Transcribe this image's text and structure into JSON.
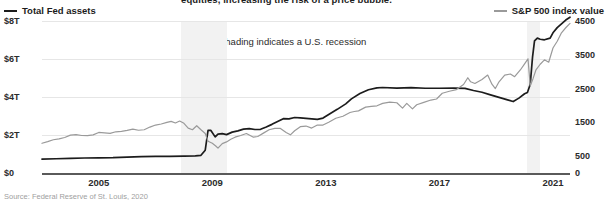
{
  "caption_fragment": "equities, increasing the risk of a price bubble.",
  "legend": {
    "left": {
      "label": "Total Fed assets",
      "color": "#1c1c1c",
      "marker": "line-swatch"
    },
    "right": {
      "label": "S&P 500 index value",
      "color": "#9a9a9a",
      "marker": "line-swatch"
    }
  },
  "annotation": {
    "arrow_icon": "◂",
    "text": "Shading indicates a U.S. recession"
  },
  "source": "Source: Federal Reserve of St. Louis, 2020",
  "chart_data": {
    "type": "line",
    "title": "",
    "subtitle": "",
    "xlabel": "",
    "ylabel": "",
    "grid": true,
    "legend_position": "top",
    "x_axis": {
      "ticks": [
        2005,
        2009,
        2013,
        2017,
        2021
      ],
      "tick_labels": [
        "2005",
        "2009",
        "2013",
        "2017",
        "2021"
      ],
      "xlim": [
        2003.0,
        2021.6
      ]
    },
    "y_axis_left": {
      "label": "Total Fed assets",
      "ticks": [
        0,
        2,
        4,
        6,
        8
      ],
      "tick_labels": [
        "$0",
        "$2T",
        "$4T",
        "$6T",
        "$8T"
      ],
      "ylim": [
        0,
        8
      ],
      "units": "trillions of USD"
    },
    "y_axis_right": {
      "label": "S&P 500 index value",
      "ticks": [
        0,
        500,
        1500,
        2500,
        3500,
        4500
      ],
      "tick_labels": [
        "0",
        "500",
        "1500",
        "2500",
        "3500",
        "4500"
      ],
      "ylim": [
        0,
        4500
      ]
    },
    "shaded_regions": [
      {
        "label": "U.S. recession 2007-2009",
        "x_start": 2007.9,
        "x_end": 2009.5,
        "color": "#f2f2f2"
      },
      {
        "label": "U.S. recession 2020",
        "x_start": 2020.1,
        "x_end": 2020.55,
        "color": "#f2f2f2"
      }
    ],
    "series": [
      {
        "name": "Total Fed assets",
        "axis": "left",
        "color": "#1c1c1c",
        "units": "trillions of USD",
        "points": [
          [
            2003.0,
            0.73
          ],
          [
            2003.5,
            0.75
          ],
          [
            2004.0,
            0.77
          ],
          [
            2004.5,
            0.79
          ],
          [
            2005.0,
            0.8
          ],
          [
            2005.5,
            0.81
          ],
          [
            2006.0,
            0.84
          ],
          [
            2006.5,
            0.86
          ],
          [
            2007.0,
            0.87
          ],
          [
            2007.5,
            0.88
          ],
          [
            2008.0,
            0.89
          ],
          [
            2008.4,
            0.9
          ],
          [
            2008.6,
            0.93
          ],
          [
            2008.75,
            1.2
          ],
          [
            2008.85,
            2.25
          ],
          [
            2008.95,
            2.24
          ],
          [
            2009.1,
            1.9
          ],
          [
            2009.2,
            2.05
          ],
          [
            2009.35,
            2.07
          ],
          [
            2009.5,
            2.02
          ],
          [
            2009.7,
            2.15
          ],
          [
            2009.9,
            2.22
          ],
          [
            2010.1,
            2.31
          ],
          [
            2010.3,
            2.34
          ],
          [
            2010.5,
            2.29
          ],
          [
            2010.7,
            2.3
          ],
          [
            2010.9,
            2.42
          ],
          [
            2011.1,
            2.56
          ],
          [
            2011.3,
            2.71
          ],
          [
            2011.5,
            2.86
          ],
          [
            2011.7,
            2.85
          ],
          [
            2011.9,
            2.92
          ],
          [
            2012.1,
            2.9
          ],
          [
            2012.4,
            2.86
          ],
          [
            2012.7,
            2.82
          ],
          [
            2012.9,
            2.89
          ],
          [
            2013.1,
            3.08
          ],
          [
            2013.4,
            3.35
          ],
          [
            2013.7,
            3.64
          ],
          [
            2013.9,
            3.9
          ],
          [
            2014.2,
            4.18
          ],
          [
            2014.5,
            4.38
          ],
          [
            2014.8,
            4.48
          ],
          [
            2015.0,
            4.5
          ],
          [
            2015.5,
            4.47
          ],
          [
            2016.0,
            4.49
          ],
          [
            2016.5,
            4.46
          ],
          [
            2017.0,
            4.46
          ],
          [
            2017.5,
            4.47
          ],
          [
            2017.9,
            4.45
          ],
          [
            2018.2,
            4.34
          ],
          [
            2018.5,
            4.25
          ],
          [
            2018.8,
            4.11
          ],
          [
            2019.1,
            3.98
          ],
          [
            2019.4,
            3.85
          ],
          [
            2019.6,
            3.76
          ],
          [
            2019.8,
            3.94
          ],
          [
            2020.0,
            4.17
          ],
          [
            2020.1,
            4.24
          ],
          [
            2020.2,
            4.67
          ],
          [
            2020.28,
            6.1
          ],
          [
            2020.35,
            6.95
          ],
          [
            2020.45,
            7.1
          ],
          [
            2020.55,
            7.04
          ],
          [
            2020.7,
            7.01
          ],
          [
            2020.9,
            7.1
          ],
          [
            2021.0,
            7.38
          ],
          [
            2021.15,
            7.65
          ],
          [
            2021.3,
            7.85
          ],
          [
            2021.45,
            8.05
          ],
          [
            2021.6,
            8.2
          ]
        ]
      },
      {
        "name": "S&P 500 index value",
        "axis": "right",
        "color": "#9a9a9a",
        "units": "index points",
        "points": [
          [
            2003.0,
            880
          ],
          [
            2003.2,
            930
          ],
          [
            2003.4,
            985
          ],
          [
            2003.6,
            1010
          ],
          [
            2003.8,
            1050
          ],
          [
            2004.0,
            1120
          ],
          [
            2004.2,
            1135
          ],
          [
            2004.4,
            1110
          ],
          [
            2004.6,
            1105
          ],
          [
            2004.8,
            1130
          ],
          [
            2005.0,
            1200
          ],
          [
            2005.2,
            1190
          ],
          [
            2005.4,
            1175
          ],
          [
            2005.6,
            1220
          ],
          [
            2005.8,
            1230
          ],
          [
            2006.0,
            1260
          ],
          [
            2006.2,
            1300
          ],
          [
            2006.4,
            1265
          ],
          [
            2006.6,
            1280
          ],
          [
            2006.8,
            1360
          ],
          [
            2007.0,
            1420
          ],
          [
            2007.2,
            1450
          ],
          [
            2007.4,
            1500
          ],
          [
            2007.55,
            1530
          ],
          [
            2007.7,
            1480
          ],
          [
            2007.85,
            1540
          ],
          [
            2008.0,
            1470
          ],
          [
            2008.15,
            1330
          ],
          [
            2008.3,
            1280
          ],
          [
            2008.45,
            1400
          ],
          [
            2008.6,
            1280
          ],
          [
            2008.75,
            1170
          ],
          [
            2008.85,
            940
          ],
          [
            2009.0,
            880
          ],
          [
            2009.12,
            800
          ],
          [
            2009.2,
            735
          ],
          [
            2009.35,
            870
          ],
          [
            2009.5,
            920
          ],
          [
            2009.65,
            1000
          ],
          [
            2009.8,
            1060
          ],
          [
            2010.0,
            1110
          ],
          [
            2010.2,
            1170
          ],
          [
            2010.45,
            1060
          ],
          [
            2010.6,
            1080
          ],
          [
            2010.8,
            1180
          ],
          [
            2011.0,
            1280
          ],
          [
            2011.2,
            1320
          ],
          [
            2011.4,
            1320
          ],
          [
            2011.6,
            1200
          ],
          [
            2011.75,
            1130
          ],
          [
            2011.9,
            1250
          ],
          [
            2012.1,
            1370
          ],
          [
            2012.3,
            1390
          ],
          [
            2012.5,
            1330
          ],
          [
            2012.7,
            1420
          ],
          [
            2012.9,
            1420
          ],
          [
            2013.1,
            1500
          ],
          [
            2013.35,
            1620
          ],
          [
            2013.6,
            1680
          ],
          [
            2013.85,
            1790
          ],
          [
            2014.0,
            1820
          ],
          [
            2014.15,
            1840
          ],
          [
            2014.4,
            1950
          ],
          [
            2014.6,
            1970
          ],
          [
            2014.8,
            1990
          ],
          [
            2015.0,
            2060
          ],
          [
            2015.25,
            2100
          ],
          [
            2015.5,
            2080
          ],
          [
            2015.7,
            1920
          ],
          [
            2015.85,
            2060
          ],
          [
            2016.05,
            1900
          ],
          [
            2016.2,
            2020
          ],
          [
            2016.45,
            2090
          ],
          [
            2016.7,
            2160
          ],
          [
            2016.9,
            2190
          ],
          [
            2017.1,
            2360
          ],
          [
            2017.35,
            2420
          ],
          [
            2017.6,
            2470
          ],
          [
            2017.85,
            2620
          ],
          [
            2018.0,
            2820
          ],
          [
            2018.1,
            2700
          ],
          [
            2018.25,
            2650
          ],
          [
            2018.5,
            2770
          ],
          [
            2018.7,
            2900
          ],
          [
            2018.85,
            2630
          ],
          [
            2018.97,
            2500
          ],
          [
            2019.1,
            2700
          ],
          [
            2019.3,
            2900
          ],
          [
            2019.5,
            2930
          ],
          [
            2019.65,
            2850
          ],
          [
            2019.85,
            3050
          ],
          [
            2020.0,
            3230
          ],
          [
            2020.12,
            3380
          ],
          [
            2020.2,
            2580
          ],
          [
            2020.3,
            2800
          ],
          [
            2020.4,
            3050
          ],
          [
            2020.55,
            3220
          ],
          [
            2020.7,
            3350
          ],
          [
            2020.85,
            3280
          ],
          [
            2021.0,
            3700
          ],
          [
            2021.15,
            3900
          ],
          [
            2021.3,
            4150
          ],
          [
            2021.45,
            4300
          ],
          [
            2021.6,
            4430
          ]
        ]
      }
    ]
  }
}
